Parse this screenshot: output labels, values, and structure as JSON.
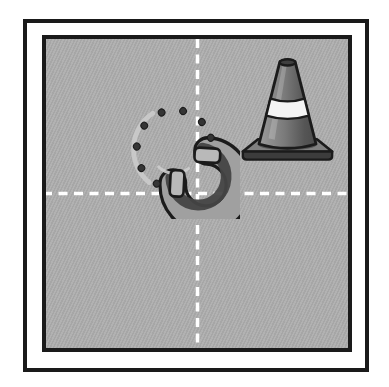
{
  "image": {
    "kind": "quadrant-grid-illustration",
    "grid": {
      "rows": 2,
      "columns": 2,
      "divider_style": "white dashed lines"
    },
    "items": [
      {
        "name": "horseshoe",
        "quadrant": "top-left",
        "row": 1,
        "col": 1
      },
      {
        "name": "traffic cone",
        "quadrant": "top-right",
        "row": 1,
        "col": 2
      }
    ],
    "empty_quadrants": [
      "bottom-left",
      "bottom-right"
    ]
  },
  "colors": {
    "frame_black": "#1a1a1a",
    "panel_gray": "#aeaeae",
    "dash_white": "#ffffff",
    "outline_black": "#1b1b1b",
    "horseshoe_body": "#a0a0a0",
    "horseshoe_inner_shadow": "#454545",
    "horseshoe_highlight": "#cdcdcd",
    "horseshoe_hole": "#353535",
    "horseshoe_heel_cap": "#b9b9b9",
    "cone_body_light": "#9c9c9c",
    "cone_body_mid": "#7a7a7a",
    "cone_body_dark": "#555555",
    "cone_stripe": "#f3f3f3",
    "cone_top_opening": "#3f3f3f",
    "cone_base_top": "#808080",
    "cone_base_front": "#3c3c3c"
  }
}
